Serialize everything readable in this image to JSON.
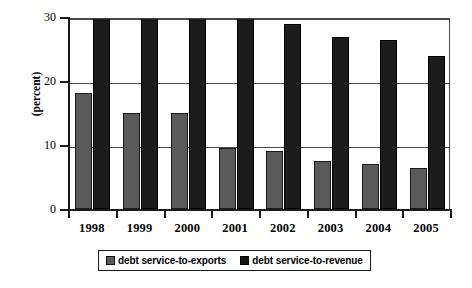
{
  "chart_data": {
    "type": "bar",
    "title": "",
    "xlabel": "",
    "ylabel": "(percent)",
    "ylim": [
      0,
      30
    ],
    "yticks": [
      0,
      10,
      20,
      30
    ],
    "grid": true,
    "legend_position": "bottom",
    "categories": [
      "1998",
      "1999",
      "2000",
      "2001",
      "2002",
      "2003",
      "2004",
      "2005"
    ],
    "series": [
      {
        "name": "debt service-to-exports",
        "color": "#5a5a5a",
        "values": [
          18.2,
          15.0,
          15.0,
          9.6,
          9.0,
          7.5,
          7.0,
          6.4
        ]
      },
      {
        "name": "debt service-to-revenue",
        "color": "#1c1c1c",
        "values": [
          30.3,
          30.3,
          30.2,
          29.9,
          28.9,
          26.9,
          26.4,
          23.9
        ]
      }
    ]
  },
  "axis": {
    "y_title": "(percent)",
    "y_tick_labels": [
      "30",
      "20",
      "10",
      "0"
    ]
  },
  "legend": {
    "items": [
      {
        "label": "debt service-to-exports",
        "swatch": "exports"
      },
      {
        "label": "debt service-to-revenue",
        "swatch": "revenue"
      }
    ]
  }
}
